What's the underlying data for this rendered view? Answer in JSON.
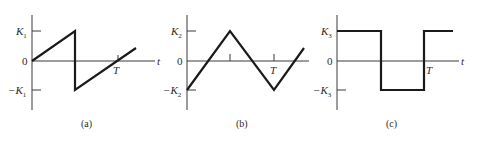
{
  "figure": {
    "panels": [
      {
        "id": "a",
        "caption": "(a)",
        "waveform": "sawtooth",
        "labels": {
          "pos": "K",
          "pos_sub": "1",
          "zero": "0",
          "neg": "−K",
          "neg_sub": "1",
          "period": "T",
          "time": "t"
        }
      },
      {
        "id": "b",
        "caption": "(b)",
        "waveform": "triangle",
        "labels": {
          "pos": "K",
          "pos_sub": "2",
          "zero": "0",
          "neg": "−K",
          "neg_sub": "2",
          "period": "T",
          "time": "t"
        }
      },
      {
        "id": "c",
        "caption": "(c)",
        "waveform": "square",
        "labels": {
          "pos": "K",
          "pos_sub": "3",
          "zero": "0",
          "neg": "−K",
          "neg_sub": "3",
          "period": "T",
          "time": "t"
        }
      }
    ]
  },
  "colors": {
    "line": "#1a1a1a",
    "axis": "#3a3a3a",
    "background": "#ffffff"
  }
}
